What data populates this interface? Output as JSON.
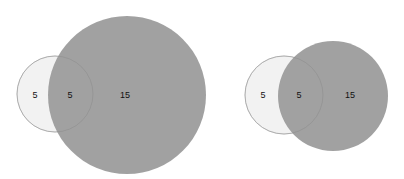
{
  "diagrams": [
    {
      "name": "venn-left",
      "sets": [
        {
          "id": "A",
          "only_count": "5",
          "fill": "#f2f2f2",
          "stroke": "#cccccc",
          "cx": 55,
          "cy": 94,
          "r": 38
        },
        {
          "id": "B",
          "only_count": "15",
          "fill": "#9e9e9e",
          "stroke": "#9e9e9e",
          "cx": 127,
          "cy": 95,
          "r": 79
        }
      ],
      "intersection_count": "5",
      "labels": {
        "a_only": "5",
        "intersection": "5",
        "b_only": "15"
      }
    },
    {
      "name": "venn-right",
      "sets": [
        {
          "id": "A",
          "only_count": "5",
          "fill": "#f2f2f2",
          "stroke": "#cccccc",
          "cx": 284,
          "cy": 95,
          "r": 39
        },
        {
          "id": "B",
          "only_count": "15",
          "fill": "#9e9e9e",
          "stroke": "#9e9e9e",
          "cx": 333,
          "cy": 96,
          "r": 55
        }
      ],
      "intersection_count": "5",
      "labels": {
        "a_only": "5",
        "intersection": "5",
        "b_only": "15"
      }
    }
  ],
  "colors": {
    "set_a_fill": "#f2f2f2",
    "set_a_stroke": "#cccccc",
    "set_b_fill": "#9e9e9e",
    "intersection_outline": "#8a8a8a",
    "label": "#111111",
    "background": "#ffffff"
  }
}
